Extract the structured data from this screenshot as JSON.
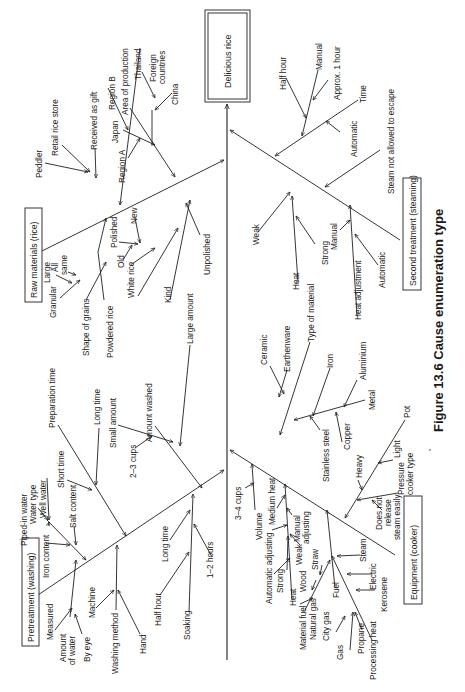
{
  "figure": {
    "caption": "Figure 13.6  Cause enumeration type",
    "orientation": "rotated 90° counter-clockwise (text reads bottom-to-top)",
    "effect": "Delicious rice",
    "categories": [
      {
        "name": "Raw materials (rice)",
        "causes": [
          {
            "label": "Area of production",
            "sub": [
              {
                "label": "Japan",
                "sub": [
                  "Region A",
                  "Region B"
                ]
              },
              {
                "label": "Foreign countries",
                "sub": [
                  "Thailand",
                  "China"
                ]
              }
            ]
          },
          {
            "label": "Peddler"
          },
          {
            "label": "Retail rice store"
          },
          {
            "label": "Received as gift"
          },
          {
            "label": "Shape of grains",
            "sub": [
              {
                "label": "Granular",
                "sub": [
                  "Large",
                  "All same"
                ]
              }
            ]
          },
          {
            "label": "Powdered rice"
          },
          {
            "label": "Kind",
            "sub": [
              {
                "label": "White rice",
                "sub": [
                  "Polished",
                  "New",
                  "Old"
                ]
              },
              {
                "label": "Unpolished"
              }
            ]
          }
        ]
      },
      {
        "name": "Second treatment (steaming)",
        "causes": [
          {
            "label": "Time",
            "sub": [
              {
                "label": "Manual",
                "sub": [
                  "Half hour",
                  "Approx. 1 hour"
                ]
              },
              {
                "label": "Automatic"
              }
            ]
          },
          {
            "label": "Steam not allowed to escape"
          },
          {
            "label": "Heat",
            "sub": [
              "Weak",
              "Strong"
            ]
          },
          {
            "label": "Heat adjustment",
            "sub": [
              "Manual",
              "Automatic"
            ]
          }
        ]
      },
      {
        "name": "Pretreatment (washing)",
        "causes": [
          {
            "label": "Water type",
            "sub": [
              "Piped-in water",
              "Well water",
              "Iron content",
              "Salt content"
            ]
          },
          {
            "label": "Preparation time",
            "sub": [
              "Short time",
              "Long time"
            ]
          },
          {
            "label": "Amount washed",
            "sub": [
              {
                "label": "Small amount",
                "sub": [
                  "2–3 cups"
                ]
              },
              {
                "label": "Large amount"
              }
            ]
          },
          {
            "label": "Amount of water",
            "sub": [
              "Measured",
              "By eye"
            ]
          },
          {
            "label": "Washing method",
            "sub": [
              "Machine",
              "Hand"
            ]
          },
          {
            "label": "Soaking",
            "sub": [
              "Half hour",
              "Long time",
              "1–2 hours"
            ]
          }
        ]
      },
      {
        "name": "Equipment (cooker)",
        "causes": [
          {
            "label": "Volume",
            "sub": [
              "3–4 cups"
            ]
          },
          {
            "label": "Heat",
            "sub": [
              "Medium heat",
              "Manual adjusting",
              "Automatic adjusting",
              "Weak",
              "Strong"
            ]
          },
          {
            "label": "Type of material",
            "sub": [
              {
                "label": "Ceramic"
              },
              {
                "label": "Earthenware"
              },
              {
                "label": "Iron"
              },
              {
                "label": "Metal",
                "sub": [
                  "Aluminium",
                  "Copper",
                  "Stainless steel"
                ]
              }
            ]
          },
          {
            "label": "Pot",
            "sub": [
              "Heavy",
              "Light"
            ]
          },
          {
            "label": "Pressure cooker type",
            "sub": [
              "Does not release steam easily"
            ]
          },
          {
            "label": "Fuel",
            "sub": [
              {
                "label": "Material fuel",
                "sub": [
                  "Wood",
                  "Straw"
                ]
              },
              {
                "label": "Natural gas"
              },
              {
                "label": "Steam"
              },
              {
                "label": "Processing heat",
                "sub": [
                  "Electric",
                  "Kerosene",
                  {
                    "label": "Gas",
                    "sub": [
                      "City gas",
                      "Propane"
                    ]
                  }
                ]
              }
            ]
          }
        ]
      }
    ]
  },
  "labels": {
    "effect": "Delicious rice",
    "cat_raw": "Raw materials (rice)",
    "cat_steam": "Second treatment (steaming)",
    "cat_wash": "Pretreatment (washing)",
    "cat_equip": "Equipment (cooker)",
    "caption": "Figure 13.6  Cause enumeration type",
    "peddler": "Peddler",
    "retail": "Retail rice store",
    "gift": "Received as gift",
    "region_a": "Region A",
    "japan": "Japan",
    "region_b": "Region B",
    "area": "Area of production",
    "thailand": "Thailand",
    "foreign1": "Foreign",
    "foreign2": "countries",
    "china": "China",
    "granular": "Granular",
    "large": "Large",
    "all1": "All",
    "all2": "same",
    "shape": "Shape of grains",
    "powdered": "Powdered rice",
    "old": "Old",
    "polished": "Polished",
    "new": "New",
    "white": "White rice",
    "kind": "Kind",
    "unpolished": "Unpolished",
    "half_hour_s": "Half hour",
    "manual_s": "Manual",
    "approx": "Approx. 1 hour",
    "automatic_s": "Automatic",
    "time": "Time",
    "steam_escape": "Steam not allowed to escape",
    "weak_s": "Weak",
    "heat_s": "Heat",
    "strong_s": "Strong",
    "manual_s2": "Manual",
    "heat_adj": "Heat adjustment",
    "automatic_s2": "Automatic",
    "piped": "Piped-in water",
    "water_type": "Water type",
    "well": "Well water",
    "iron_content": "Iron content",
    "salt": "Salt content",
    "short_time": "Short time",
    "prep_time": "Preparation time",
    "long_time": "Long time",
    "cups23": "2–3 cups",
    "small_amount": "Small amount",
    "amount_washed": "Amount washed",
    "large_amount": "Large amount",
    "measured": "Measured",
    "amount1": "Amount",
    "amount2": "of water",
    "by_eye": "By eye",
    "machine": "Machine",
    "washing_method": "Washing method",
    "hand": "Hand",
    "half_hour_w": "Half hour",
    "long_time_w": "Long time",
    "soaking": "Soaking",
    "hours12": "1–2 hours",
    "cups34": "3–4 cups",
    "volume": "Volume",
    "medium_heat": "Medium heat",
    "auto_adj": "Automatic adjusting",
    "manual1": "Manual",
    "manual2": "adjusting",
    "strong_e": "Strong",
    "weak_e": "Weak",
    "heat_e": "Heat",
    "material_fuel": "Material fuel",
    "wood": "Wood",
    "straw": "Straw",
    "natural_gas": "Natural gas",
    "city_gas": "City gas",
    "gas": "Gas",
    "propane": "Propane",
    "processing_heat": "Processing heat",
    "fuel": "Fuel",
    "steam_e": "Steam",
    "electric": "Electric",
    "kerosene": "Kerosene",
    "ceramic": "Ceramic",
    "earthenware": "Earthenware",
    "type_material": "Type of material",
    "iron": "Iron",
    "aluminium": "Aluminium",
    "stainless": "Stainless steel",
    "copper": "Copper",
    "metal": "Metal",
    "heavy": "Heavy",
    "light": "Light",
    "pot": "Pot",
    "dnr1": "Does not",
    "dnr2": "release",
    "dnr3": "steam easily",
    "pressure1": "Pressure",
    "pressure2": "cooker type"
  }
}
